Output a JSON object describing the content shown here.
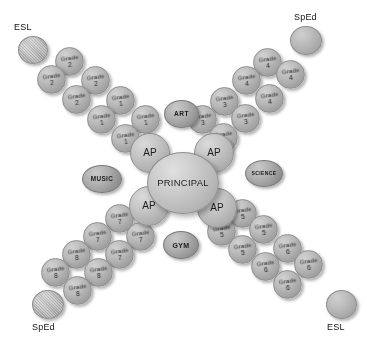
{
  "diagram": {
    "type": "radial-x-org-chart",
    "center": {
      "label": "PRINCIPAL"
    },
    "assistant_principals": [
      {
        "label": "AP",
        "arm": "upper-left"
      },
      {
        "label": "AP",
        "arm": "upper-right"
      },
      {
        "label": "AP",
        "arm": "lower-left"
      },
      {
        "label": "AP",
        "arm": "lower-right"
      }
    ],
    "specialists": [
      {
        "label": "ART",
        "position": "top-center-left"
      },
      {
        "label": "SCIENCE",
        "position": "right"
      },
      {
        "label": "MUSIC",
        "position": "left"
      },
      {
        "label": "GYM",
        "position": "bottom-center"
      }
    ],
    "corner_supports": [
      {
        "label": "ESL",
        "corner": "top-left"
      },
      {
        "label": "SpEd",
        "corner": "top-right"
      },
      {
        "label": "SpEd",
        "corner": "bottom-left"
      },
      {
        "label": "ESL",
        "corner": "bottom-right"
      }
    ],
    "arms": [
      {
        "name": "upper-left",
        "grades": [
          {
            "word": "Grade",
            "num": "1"
          },
          {
            "word": "Grade",
            "num": "1"
          },
          {
            "word": "Grade",
            "num": "1"
          },
          {
            "word": "Grade",
            "num": "1"
          },
          {
            "word": "Grade",
            "num": "2"
          },
          {
            "word": "Grade",
            "num": "2"
          },
          {
            "word": "Grade",
            "num": "2"
          },
          {
            "word": "Grade",
            "num": "2"
          }
        ]
      },
      {
        "name": "upper-right",
        "grades": [
          {
            "word": "Grade",
            "num": "3"
          },
          {
            "word": "Grade",
            "num": "3"
          },
          {
            "word": "Grade",
            "num": "3"
          },
          {
            "word": "Grade",
            "num": "3"
          },
          {
            "word": "Grade",
            "num": "4"
          },
          {
            "word": "Grade",
            "num": "4"
          },
          {
            "word": "Grade",
            "num": "4"
          },
          {
            "word": "Grade",
            "num": "4"
          }
        ]
      },
      {
        "name": "lower-right",
        "grades": [
          {
            "word": "Grade",
            "num": "5"
          },
          {
            "word": "Grade",
            "num": "5"
          },
          {
            "word": "Grade",
            "num": "5"
          },
          {
            "word": "Grade",
            "num": "5"
          },
          {
            "word": "Grade",
            "num": "6"
          },
          {
            "word": "Grade",
            "num": "6"
          },
          {
            "word": "Grade",
            "num": "6"
          },
          {
            "word": "Grade",
            "num": "6"
          }
        ]
      },
      {
        "name": "lower-left",
        "grades": [
          {
            "word": "Grade",
            "num": "7"
          },
          {
            "word": "Grade",
            "num": "7"
          },
          {
            "word": "Grade",
            "num": "7"
          },
          {
            "word": "Grade",
            "num": "7"
          },
          {
            "word": "Grade",
            "num": "8"
          },
          {
            "word": "Grade",
            "num": "8"
          },
          {
            "word": "Grade",
            "num": "8"
          },
          {
            "word": "Grade",
            "num": "8"
          }
        ]
      }
    ],
    "colors": {
      "background": "#ffffff",
      "bubble_light": "#d8d8d8",
      "bubble_mid": "#b4b4b4",
      "bubble_dark": "#8e8e8e",
      "text": "#1b1b1b"
    }
  }
}
